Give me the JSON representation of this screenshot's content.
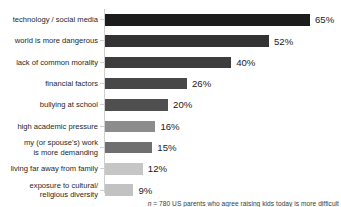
{
  "chart_data": {
    "type": "bar",
    "orientation": "horizontal",
    "title": "",
    "subtitle": "",
    "xlabel": "",
    "ylabel": "",
    "xlim": [
      0,
      65
    ],
    "grid": false,
    "legend": "none",
    "value_suffix": "%",
    "categories": [
      "technology / social media",
      "world is more dangerous",
      "lack of common morality",
      "financial factors",
      "bullying at school",
      "high academic pressure",
      "my (or spouse's) work is more demanding",
      "living far away from family",
      "exposure to cultural/ religious diversity"
    ],
    "values": [
      65,
      52,
      40,
      26,
      20,
      16,
      15,
      12,
      9
    ],
    "value_labels": [
      "65%",
      "52%",
      "40%",
      "26%",
      "20%",
      "16%",
      "15%",
      "12%",
      "9%"
    ],
    "bar_colors": [
      "#1c1c1c",
      "#333333",
      "#3d3d3d",
      "#474747",
      "#4f4f4f",
      "#8c8c8c",
      "#6f6f6f",
      "#c6c6c6",
      "#c2c2c2"
    ],
    "annotations": [
      "n = 780 US parents who agree raising kids today is more difficult"
    ]
  },
  "chart": {
    "bars": [
      {
        "label_lines": [
          "technology / social media"
        ],
        "value": 65,
        "value_label": "65%",
        "color": "#1c1c1c"
      },
      {
        "label_lines": [
          "world is more dangerous"
        ],
        "value": 52,
        "value_label": "52%",
        "color": "#333333"
      },
      {
        "label_lines": [
          "lack of common morality"
        ],
        "value": 40,
        "value_label": "40%",
        "color": "#3d3d3d"
      },
      {
        "label_lines": [
          "financial factors"
        ],
        "value": 26,
        "value_label": "26%",
        "color": "#474747"
      },
      {
        "label_lines": [
          "bullying at school"
        ],
        "value": 20,
        "value_label": "20%",
        "color": "#4f4f4f"
      },
      {
        "label_lines": [
          "high academic pressure"
        ],
        "value": 16,
        "value_label": "16%",
        "color": "#8c8c8c"
      },
      {
        "label_lines": [
          "my (or spouse's) work",
          "is more demanding"
        ],
        "value": 15,
        "value_label": "15%",
        "color": "#6f6f6f"
      },
      {
        "label_lines": [
          "living far away from family"
        ],
        "value": 12,
        "value_label": "12%",
        "color": "#c6c6c6"
      },
      {
        "label_lines": [
          "exposure to cultural/",
          "religious diversity"
        ],
        "value": 9,
        "value_label": "9%",
        "color": "#c2c2c2"
      }
    ],
    "footnote_n": "n",
    "footnote_rest": " = 780 US parents who agree raising kids today is more difficult",
    "axis_color": "#cfcfcf"
  }
}
